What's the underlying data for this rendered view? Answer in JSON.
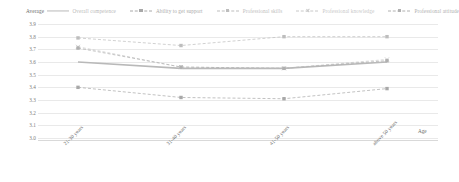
{
  "legend": {
    "title": "Average",
    "items": [
      {
        "label": "Overall competence",
        "color": "#b9b9b9",
        "marker": "line",
        "style": "solid"
      },
      {
        "label": "Ability to get support",
        "color": "#a8a8a8",
        "marker": "square",
        "style": "dashed"
      },
      {
        "label": "Professional skills",
        "color": "#bdbdbd",
        "marker": "square",
        "style": "dashed"
      },
      {
        "label": "Professional knowledge",
        "color": "#c8c8c8",
        "marker": "x",
        "style": "dashed"
      },
      {
        "label": "Professional attitude",
        "color": "#b0b0b0",
        "marker": "square",
        "style": "dashed"
      }
    ]
  },
  "axis": {
    "x_title": "Age",
    "y_ticks": [
      "3.9",
      "3.8",
      "3.7",
      "3.6",
      "3.5",
      "3.4",
      "3.3",
      "3.2",
      "3.1",
      "3.0"
    ],
    "x_labels": [
      "21-30  years",
      "31-40  years",
      "41-50  years",
      "above 50  years"
    ]
  },
  "chart_data": {
    "type": "line",
    "title": "",
    "xlabel": "Age",
    "ylabel": "Average",
    "ylim": [
      3.0,
      3.9
    ],
    "grid": true,
    "legend_position": "top",
    "categories": [
      "21-30  years",
      "31-40  years",
      "41-50  years",
      "above 50  years"
    ],
    "series": [
      {
        "name": "Overall competence",
        "values": [
          3.6,
          3.55,
          3.55,
          3.6
        ],
        "color": "#b9b9b9"
      },
      {
        "name": "Ability to get support",
        "values": [
          3.4,
          3.32,
          3.31,
          3.39
        ],
        "color": "#a8a8a8"
      },
      {
        "name": "Professional skills",
        "values": [
          3.79,
          3.73,
          3.8,
          3.8
        ],
        "color": "#bdbdbd"
      },
      {
        "name": "Professional knowledge",
        "values": [
          3.72,
          3.56,
          3.55,
          3.62
        ],
        "color": "#c8c8c8"
      },
      {
        "name": "Professional attitude",
        "values": [
          3.71,
          3.56,
          3.55,
          3.61
        ],
        "color": "#b0b0b0"
      }
    ]
  }
}
